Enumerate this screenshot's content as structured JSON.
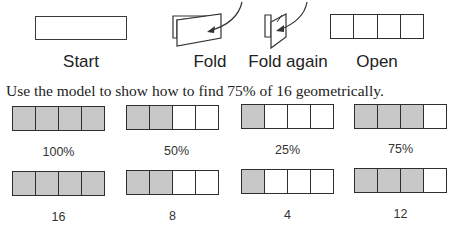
{
  "folding_steps": [
    {
      "label": "Start",
      "graphic": "blank-strip"
    },
    {
      "label": "Fold",
      "graphic": "folded-once-with-arrow"
    },
    {
      "label": "Fold again",
      "graphic": "folded-twice-with-arrow"
    },
    {
      "label": "Open",
      "graphic": "strip-with-4-sections"
    }
  ],
  "instruction": "Use the model to show how to find 75% of 16 geometrically.",
  "colors": {
    "shaded": "#c8c8c8",
    "outline": "#2e2e2e"
  },
  "percent_row": [
    {
      "label": "100%",
      "shaded_cells": 4,
      "total_cells": 4
    },
    {
      "label": "50%",
      "shaded_cells": 2,
      "total_cells": 4
    },
    {
      "label": "25%",
      "shaded_cells": 1,
      "total_cells": 4
    },
    {
      "label": "75%",
      "shaded_cells": 3,
      "total_cells": 4
    }
  ],
  "value_row": [
    {
      "label": "16",
      "shaded_cells": 4,
      "total_cells": 4
    },
    {
      "label": "8",
      "shaded_cells": 2,
      "total_cells": 4
    },
    {
      "label": "4",
      "shaded_cells": 1,
      "total_cells": 4
    },
    {
      "label": "12",
      "shaded_cells": 3,
      "total_cells": 4
    }
  ]
}
